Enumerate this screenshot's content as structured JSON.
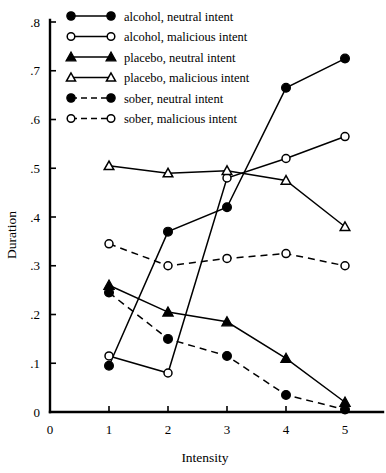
{
  "chart_data": {
    "type": "line",
    "title": "",
    "xlabel": "Intensity",
    "ylabel": "Duration",
    "xlim": [
      0,
      5.45
    ],
    "ylim": [
      0,
      0.8
    ],
    "grid": false,
    "legend_position": "top-left-inside",
    "x": [
      1,
      2,
      3,
      4,
      5
    ],
    "xticks": [
      "0",
      "1",
      "2",
      "3",
      "4",
      "5"
    ],
    "xtick_values": [
      0,
      1,
      2,
      3,
      4,
      5
    ],
    "yticks": [
      ".8",
      ".7",
      ".6",
      ".5",
      ".4",
      ".3",
      ".2",
      ".1",
      "0"
    ],
    "ytick_values": [
      0.8,
      0.7,
      0.6,
      0.5,
      0.4,
      0.3,
      0.2,
      0.1,
      0.0
    ],
    "series": [
      {
        "name": "alcohol, neutral intent",
        "marker": "filled-circle",
        "linestyle": "solid",
        "values": [
          0.095,
          0.37,
          0.42,
          0.665,
          0.725
        ]
      },
      {
        "name": "alcohol, malicious intent",
        "marker": "open-circle",
        "linestyle": "solid",
        "values": [
          0.115,
          0.08,
          0.48,
          0.52,
          0.565
        ]
      },
      {
        "name": "placebo, neutral intent",
        "marker": "filled-triangle",
        "linestyle": "solid",
        "values": [
          0.26,
          0.205,
          0.185,
          0.11,
          0.02
        ]
      },
      {
        "name": "placebo, malicious intent",
        "marker": "open-triangle",
        "linestyle": "solid",
        "values": [
          0.505,
          0.49,
          0.495,
          0.475,
          0.38
        ]
      },
      {
        "name": "sober, neutral intent",
        "marker": "filled-circle",
        "linestyle": "dashed",
        "values": [
          0.245,
          0.15,
          0.115,
          0.035,
          0.005
        ]
      },
      {
        "name": "sober, malicious intent",
        "marker": "open-circle",
        "linestyle": "dashed",
        "values": [
          0.345,
          0.3,
          0.315,
          0.325,
          0.3
        ]
      }
    ]
  }
}
